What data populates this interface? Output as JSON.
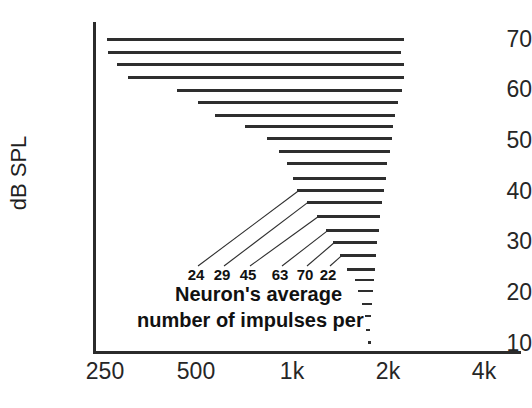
{
  "chart_data": {
    "type": "bar",
    "title": "",
    "subtitle": "",
    "xlabel": "",
    "ylabel": "dB SPL",
    "xscale": "log",
    "x_unit": "Hz",
    "xticks": [
      "250",
      "500",
      "1k",
      "2k",
      "4k"
    ],
    "xtick_values": [
      250,
      500,
      1000,
      2000,
      4000
    ],
    "yticks": [
      "70",
      "60",
      "50",
      "40",
      "30",
      "20",
      "10"
    ],
    "ytick_values": [
      70,
      60,
      50,
      40,
      30,
      20,
      10
    ],
    "ylim": [
      8,
      74
    ],
    "xlim": [
      230,
      4600
    ],
    "grid": false,
    "legend": false,
    "orientation": "horizontal",
    "bars": [
      {
        "level_db": 70.4,
        "f_low": 254,
        "f_high": 2180,
        "impulses": null
      },
      {
        "level_db": 67.9,
        "f_low": 256,
        "f_high": 2130,
        "impulses": null
      },
      {
        "level_db": 65.4,
        "f_low": 272,
        "f_high": 2180,
        "impulses": null
      },
      {
        "level_db": 62.9,
        "f_low": 296,
        "f_high": 2180,
        "impulses": null
      },
      {
        "level_db": 60.3,
        "f_low": 420,
        "f_high": 2140,
        "impulses": null
      },
      {
        "level_db": 57.9,
        "f_low": 490,
        "f_high": 2090,
        "impulses": null
      },
      {
        "level_db": 55.4,
        "f_low": 555,
        "f_high": 2040,
        "impulses": null
      },
      {
        "level_db": 53.2,
        "f_low": 690,
        "f_high": 2010,
        "impulses": null
      },
      {
        "level_db": 50.8,
        "f_low": 810,
        "f_high": 1990,
        "impulses": null
      },
      {
        "level_db": 48.3,
        "f_low": 880,
        "f_high": 1960,
        "impulses": null
      },
      {
        "level_db": 45.9,
        "f_low": 930,
        "f_high": 1930,
        "impulses": null
      },
      {
        "level_db": 42.9,
        "f_low": 975,
        "f_high": 1905,
        "impulses": null
      },
      {
        "level_db": 40.4,
        "f_low": 1000,
        "f_high": 1880,
        "impulses": 24
      },
      {
        "level_db": 38.2,
        "f_low": 1075,
        "f_high": 1855,
        "impulses": 29
      },
      {
        "level_db": 35.4,
        "f_low": 1160,
        "f_high": 1830,
        "impulses": 45
      },
      {
        "level_db": 32.6,
        "f_low": 1240,
        "f_high": 1810,
        "impulses": 63
      },
      {
        "level_db": 30.2,
        "f_low": 1300,
        "f_high": 1790,
        "impulses": 70
      },
      {
        "level_db": 27.6,
        "f_low": 1370,
        "f_high": 1775,
        "impulses": 22
      },
      {
        "level_db": 24.8,
        "f_low": 1440,
        "f_high": 1760,
        "impulses": null
      },
      {
        "level_db": 22.6,
        "f_low": 1530,
        "f_high": 1750,
        "impulses": null
      },
      {
        "level_db": 20.4,
        "f_low": 1560,
        "f_high": 1740,
        "impulses": null
      },
      {
        "level_db": 18.0,
        "f_low": 1600,
        "f_high": 1730,
        "impulses": null
      },
      {
        "level_db": 15.5,
        "f_low": 1640,
        "f_high": 1715,
        "impulses": null
      },
      {
        "level_db": 12.8,
        "f_low": 1650,
        "f_high": 1705,
        "impulses": null
      },
      {
        "level_db": 10.4,
        "f_low": 1675,
        "f_high": 1690,
        "impulses": null
      }
    ],
    "impulse_labels": [
      "24",
      "29",
      "45",
      "63",
      "70",
      "22"
    ],
    "annotation": {
      "line1": "Neuron's average",
      "line2": "number of impulses per"
    }
  }
}
